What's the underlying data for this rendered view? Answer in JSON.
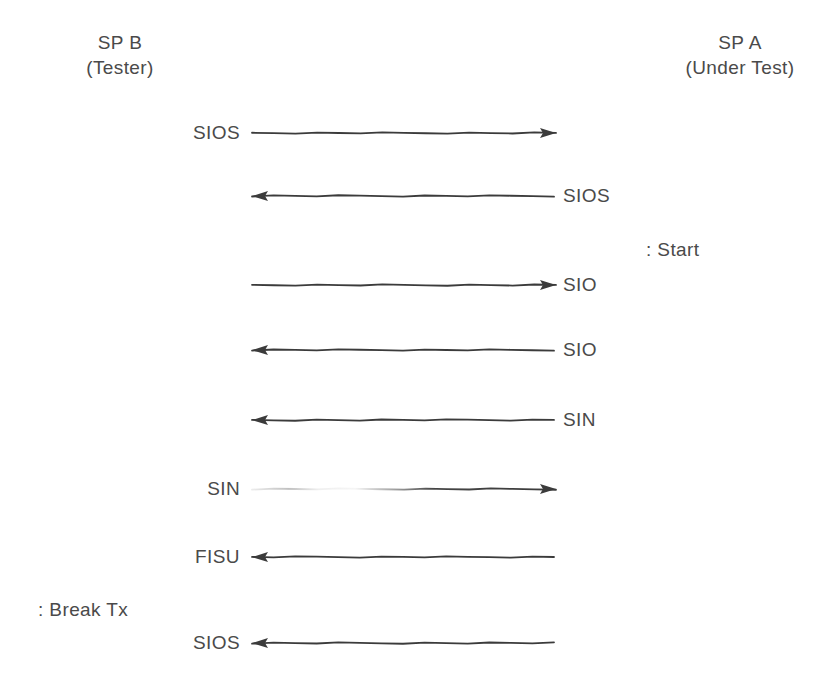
{
  "diagram": {
    "type": "sequence-diagram",
    "style": "hand-drawn",
    "ink_color": "#3b3b3b",
    "background_color": "#ffffff",
    "columns": [
      {
        "id": "sp-b",
        "name": "SP B",
        "role": "(Tester)"
      },
      {
        "id": "sp-a",
        "name": "SP A",
        "role": "(Under Test)"
      }
    ],
    "messages": [
      {
        "label": "SIOS",
        "direction": "right",
        "label_side": "left",
        "y": 133,
        "faded_start": false
      },
      {
        "label": "SIOS",
        "direction": "left",
        "label_side": "right",
        "y": 196,
        "faded_start": false
      },
      {
        "label": "SIO",
        "direction": "right",
        "label_side": "right",
        "y": 285,
        "faded_start": false
      },
      {
        "label": "SIO",
        "direction": "left",
        "label_side": "right",
        "y": 350,
        "faded_start": false
      },
      {
        "label": "SIN",
        "direction": "left",
        "label_side": "right",
        "y": 420,
        "faded_start": false
      },
      {
        "label": "SIN",
        "direction": "right",
        "label_side": "left",
        "y": 489,
        "faded_start": true
      },
      {
        "label": "FISU",
        "direction": "left",
        "label_side": "left",
        "y": 557,
        "faded_start": false
      },
      {
        "label": "SIOS",
        "direction": "left",
        "label_side": "left",
        "y": 643,
        "faded_start": false
      }
    ],
    "annotations": [
      {
        "id": "start",
        "text": ": Start",
        "x": 646,
        "y": 238
      },
      {
        "id": "break-tx",
        "text": ": Break Tx",
        "x": 38,
        "y": 598
      }
    ]
  }
}
